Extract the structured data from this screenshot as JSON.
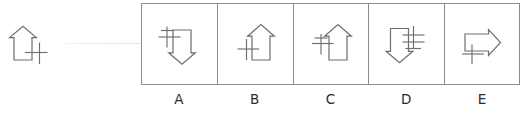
{
  "puzzle": {
    "type": "visual-analogy-multiple-choice",
    "prompt_figure": {
      "name": "reference-figure",
      "description": "outlined up arrow with plus sign at lower right",
      "arrow_direction": "up",
      "marker": "plus",
      "marker_position": "lower-right"
    },
    "options": [
      {
        "label": "A",
        "arrow_direction": "down",
        "marker": "plus",
        "marker_position": "upper-left",
        "description": "outlined down arrow with plus sign at upper left"
      },
      {
        "label": "B",
        "arrow_direction": "up",
        "marker": "plus",
        "marker_position": "lower-left",
        "description": "outlined up arrow with plus sign at lower left"
      },
      {
        "label": "C",
        "arrow_direction": "up",
        "marker": "plus",
        "marker_position": "mid-left",
        "description": "outlined up arrow with plus sign at middle left"
      },
      {
        "label": "D",
        "arrow_direction": "down",
        "marker": "double-bar-plus",
        "marker_position": "upper-right",
        "description": "outlined down arrow with double-barred plus at upper right"
      },
      {
        "label": "E",
        "arrow_direction": "right",
        "marker": "plus",
        "marker_position": "lower-left",
        "description": "outlined right arrow with plus sign at lower left"
      }
    ]
  },
  "colors": {
    "background": "#ffffff",
    "stroke": "#6e6e6e",
    "box_border": "#8d8d8d",
    "label_text": "#2b2b2b",
    "connector": "#e4e4e4"
  }
}
